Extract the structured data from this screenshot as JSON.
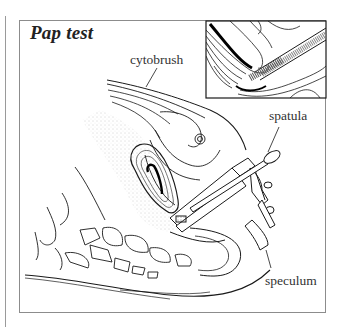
{
  "figure": {
    "title": "Pap test",
    "labels": {
      "cytobrush": "cytobrush",
      "spatula": "spatula",
      "speculum": "speculum"
    },
    "inset": "magnified view of cytobrush inserted in cervical canal",
    "colors": {
      "line": "#1a1a1a",
      "frame": "#8c8c8c",
      "stipple": "#bdbdbd",
      "background": "#ffffff"
    }
  }
}
